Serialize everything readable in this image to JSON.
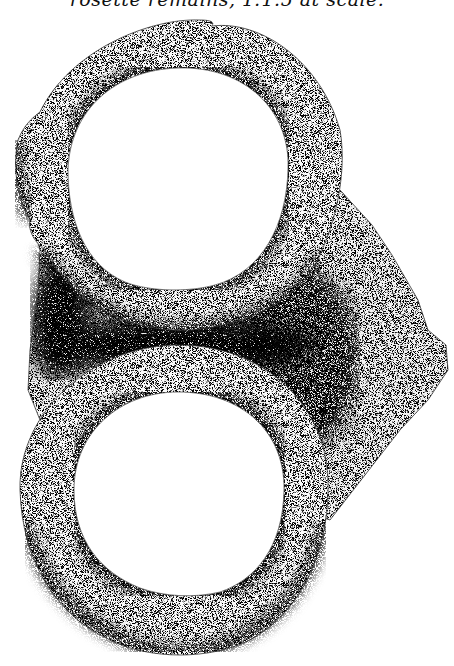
{
  "caption": {
    "text": "rosette remains, 1:1.5 at scale."
  },
  "figure": {
    "elements": [
      {
        "name": "upper-ring",
        "label": "upper ring"
      },
      {
        "name": "lower-ring",
        "label": "lower ring"
      },
      {
        "name": "connecting-plate",
        "label": "connecting plate"
      }
    ],
    "colors": {
      "background": "#ffffff",
      "ink": "#111111",
      "stipple_light": "#e8e8e8",
      "stipple_mid": "#b8b8b8",
      "stipple_dark": "#555555"
    }
  }
}
